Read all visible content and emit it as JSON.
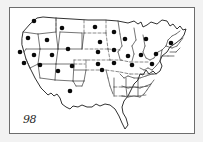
{
  "figure": {
    "corner_label": "98",
    "background_color": "#f2f2f2",
    "panel_color": "#ffffff",
    "frame_color": "#6d6d6d",
    "marker_color": "#0a0a0a",
    "boundary_color": "#3a3a3a",
    "outline_color": "#1a1a1a"
  },
  "chart_data": {
    "type": "scatter",
    "xlabel": "",
    "ylabel": "",
    "xlim": [
      0,
      186
    ],
    "ylim": [
      0,
      127
    ],
    "grid": false,
    "legend": null,
    "annotations": [
      {
        "text": "98",
        "x": 6,
        "y": 113
      }
    ],
    "series": [
      {
        "name": "marked states",
        "marker": "filled-circle",
        "marker_color": "#0a0a0a",
        "marker_size": 4.6,
        "count": 29,
        "points": [
          {
            "label": "WA",
            "x": 24,
            "y": 13
          },
          {
            "label": "MT",
            "x": 52,
            "y": 20
          },
          {
            "label": "ND",
            "x": 85,
            "y": 19
          },
          {
            "label": "MN",
            "x": 104,
            "y": 24
          },
          {
            "label": "OR",
            "x": 18,
            "y": 30
          },
          {
            "label": "ID",
            "x": 37,
            "y": 32
          },
          {
            "label": "SD",
            "x": 90,
            "y": 34
          },
          {
            "label": "WI",
            "x": 115,
            "y": 31
          },
          {
            "label": "MI",
            "x": 136,
            "y": 31
          },
          {
            "label": "NY",
            "x": 161,
            "y": 35
          },
          {
            "label": "CA-N",
            "x": 10,
            "y": 44
          },
          {
            "label": "NV",
            "x": 24,
            "y": 47
          },
          {
            "label": "UT",
            "x": 42,
            "y": 47
          },
          {
            "label": "WY",
            "x": 58,
            "y": 41
          },
          {
            "label": "NE",
            "x": 88,
            "y": 44
          },
          {
            "label": "IA",
            "x": 104,
            "y": 42
          },
          {
            "label": "IL",
            "x": 118,
            "y": 48
          },
          {
            "label": "IN",
            "x": 131,
            "y": 47
          },
          {
            "label": "OH",
            "x": 146,
            "y": 46
          },
          {
            "label": "CA-C",
            "x": 14,
            "y": 55
          },
          {
            "label": "AZ",
            "x": 30,
            "y": 57
          },
          {
            "label": "CO",
            "x": 62,
            "y": 58
          },
          {
            "label": "KS",
            "x": 88,
            "y": 56
          },
          {
            "label": "MO",
            "x": 104,
            "y": 55
          },
          {
            "label": "KY",
            "x": 122,
            "y": 57
          },
          {
            "label": "WV",
            "x": 142,
            "y": 56
          },
          {
            "label": "NM",
            "x": 48,
            "y": 63
          },
          {
            "label": "OK",
            "x": 92,
            "y": 62
          },
          {
            "label": "TX",
            "x": 60,
            "y": 83
          }
        ]
      }
    ]
  }
}
